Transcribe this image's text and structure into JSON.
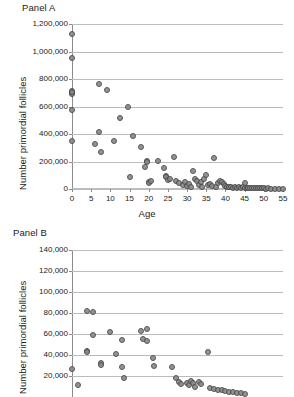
{
  "figure": {
    "ylabel_shared": "Number primordial follicles"
  },
  "panel_a": {
    "title": "Panel A",
    "ylabel": "Number primordial follicles",
    "xlabel": "Age"
  },
  "panel_b": {
    "title": "Panel B",
    "ylabel": "Number primordial follicles",
    "xlabel": ""
  },
  "chart_data": [
    {
      "type": "scatter",
      "title": "Panel A",
      "xlabel": "Age",
      "ylabel": "Number primordial follicles",
      "xlim": [
        0,
        55
      ],
      "ylim": [
        0,
        1200000
      ],
      "xticks": [
        0,
        5,
        10,
        15,
        20,
        25,
        30,
        35,
        40,
        45,
        50,
        55
      ],
      "xtick_labels": [
        "0",
        "5",
        "10",
        "15",
        "20",
        "25",
        "30",
        "35",
        "40",
        "45",
        "50",
        "55"
      ],
      "yticks": [
        0,
        200000,
        400000,
        600000,
        800000,
        1000000,
        1200000
      ],
      "ytick_labels": [
        "0",
        "200,000",
        "400,000",
        "600,000",
        "800,000",
        "1,000,000",
        "1,200,000"
      ],
      "grid": true,
      "legend": null,
      "marker": {
        "shape": "circle",
        "fill": "#8a8a8a",
        "edge": "#4a4a4a",
        "size": 6
      },
      "points": [
        [
          0,
          1128000
        ],
        [
          0,
          950000
        ],
        [
          0,
          712000
        ],
        [
          0,
          700000
        ],
        [
          0,
          690000
        ],
        [
          0,
          705000
        ],
        [
          0,
          572000
        ],
        [
          0,
          352000
        ],
        [
          6,
          325000
        ],
        [
          7,
          765000
        ],
        [
          7,
          412000
        ],
        [
          7.5,
          268000
        ],
        [
          9,
          720000
        ],
        [
          11,
          350000
        ],
        [
          12.5,
          520000
        ],
        [
          14.5,
          600000
        ],
        [
          15,
          88000
        ],
        [
          16,
          382000
        ],
        [
          18,
          305000
        ],
        [
          19,
          160000
        ],
        [
          19.5,
          205000
        ],
        [
          19.5,
          198000
        ],
        [
          20,
          48000
        ],
        [
          20,
          42000
        ],
        [
          20.5,
          55000
        ],
        [
          22.5,
          205000
        ],
        [
          24,
          150000
        ],
        [
          24.5,
          95000
        ],
        [
          24.5,
          88000
        ],
        [
          25,
          62000
        ],
        [
          25.5,
          72000
        ],
        [
          26.5,
          235000
        ],
        [
          27,
          58000
        ],
        [
          28,
          45000
        ],
        [
          29,
          30000
        ],
        [
          29.5,
          52000
        ],
        [
          30,
          22000
        ],
        [
          30.5,
          35000
        ],
        [
          31,
          12000
        ],
        [
          31.5,
          128000
        ],
        [
          32,
          70000
        ],
        [
          32.5,
          60000
        ],
        [
          33,
          28000
        ],
        [
          33.5,
          48000
        ],
        [
          34,
          18000
        ],
        [
          34.5,
          72000
        ],
        [
          35,
          100000
        ],
        [
          35.5,
          30000
        ],
        [
          36,
          38000
        ],
        [
          36.5,
          20000
        ],
        [
          37,
          222000
        ],
        [
          37.5,
          15000
        ],
        [
          38,
          45000
        ],
        [
          38.5,
          55000
        ],
        [
          39,
          50000
        ],
        [
          39.5,
          35000
        ],
        [
          40,
          25000
        ],
        [
          40.5,
          18000
        ],
        [
          41,
          12000
        ],
        [
          41.5,
          15000
        ],
        [
          42,
          10000
        ],
        [
          42.5,
          12000
        ],
        [
          43,
          9000
        ],
        [
          43.5,
          14000
        ],
        [
          44,
          8000
        ],
        [
          44.5,
          11000
        ],
        [
          45,
          42000
        ],
        [
          45,
          9000
        ],
        [
          45.5,
          7000
        ],
        [
          46,
          10000
        ],
        [
          46.5,
          6000
        ],
        [
          47,
          8000
        ],
        [
          47.5,
          5000
        ],
        [
          48,
          7000
        ],
        [
          48.5,
          4000
        ],
        [
          49,
          6000
        ],
        [
          49.5,
          5000
        ],
        [
          50,
          4000
        ],
        [
          50.5,
          3000
        ],
        [
          51,
          4000
        ],
        [
          52,
          3000
        ],
        [
          53,
          2000
        ],
        [
          54,
          2000
        ],
        [
          55,
          1500
        ]
      ]
    },
    {
      "type": "scatter",
      "title": "Panel B",
      "xlabel": "",
      "ylabel": "Number primordial follicles",
      "note": "x-axis is cropped off the bottom of the screenshot",
      "xlim": [
        0,
        55
      ],
      "ylim": [
        0,
        140000
      ],
      "yticks": [
        20000,
        40000,
        60000,
        80000,
        100000,
        120000,
        140000
      ],
      "ytick_labels": [
        "20,000",
        "40,000",
        "60,000",
        "80,000",
        "100,000",
        "120,000",
        "140,000"
      ],
      "grid": true,
      "legend": null,
      "marker": {
        "shape": "circle",
        "fill": "#8a8a8a",
        "edge": "#4a4a4a",
        "size": 6
      },
      "points": [
        [
          0,
          26500
        ],
        [
          1.5,
          11000
        ],
        [
          4,
          81500
        ],
        [
          4,
          43500
        ],
        [
          4,
          42500
        ],
        [
          5.5,
          80500
        ],
        [
          5.5,
          59500
        ],
        [
          7.5,
          32000
        ],
        [
          7.5,
          30500
        ],
        [
          10,
          62000
        ],
        [
          11.5,
          40500
        ],
        [
          13,
          54500
        ],
        [
          13,
          28500
        ],
        [
          13.5,
          18000
        ],
        [
          18,
          62500
        ],
        [
          18.5,
          55000
        ],
        [
          19.5,
          65000
        ],
        [
          19.5,
          53500
        ],
        [
          21,
          37500
        ],
        [
          21.5,
          29500
        ],
        [
          26,
          28500
        ],
        [
          27,
          18500
        ],
        [
          28,
          14000
        ],
        [
          28.5,
          12000
        ],
        [
          30,
          13500
        ],
        [
          30.5,
          11000
        ],
        [
          31,
          15000
        ],
        [
          31.5,
          13000
        ],
        [
          32,
          10000
        ],
        [
          33,
          14500
        ],
        [
          33.5,
          12500
        ],
        [
          35.5,
          42500
        ],
        [
          36,
          9000
        ],
        [
          37,
          8000
        ],
        [
          38,
          7000
        ],
        [
          39,
          6500
        ],
        [
          40,
          5500
        ],
        [
          41,
          5000
        ],
        [
          42,
          4500
        ],
        [
          43,
          4000
        ],
        [
          44,
          3500
        ],
        [
          45,
          3000
        ]
      ]
    }
  ]
}
